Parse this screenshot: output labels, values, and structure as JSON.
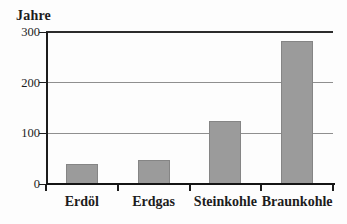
{
  "window": {
    "background_color": "#fdfdfd",
    "text_color": "#1c1c1c"
  },
  "chart_data": {
    "type": "bar",
    "title": "Jahre",
    "categories": [
      "Erdöl",
      "Erdgas",
      "Steinkohle",
      "Braunkohle"
    ],
    "values": [
      40,
      48,
      125,
      282
    ],
    "xlabel": "",
    "ylabel": "Jahre",
    "ylim": [
      0,
      300
    ],
    "yticks": [
      "0",
      "100",
      "200",
      "300"
    ],
    "grid": "horizontal",
    "legend": "none",
    "bar_color": "#9b9b9b",
    "bar_border_color": "#858585",
    "axis_color": "#1c1c1c",
    "gridline_color": "#8f8f8f",
    "top_gridline_color": "#2c2c2c"
  }
}
